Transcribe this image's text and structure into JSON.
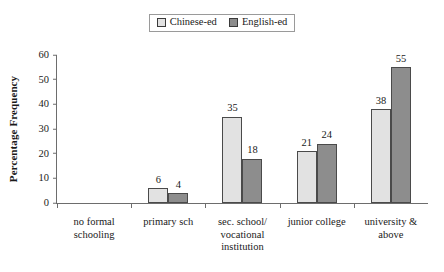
{
  "chart_data": {
    "type": "bar",
    "title": "",
    "xlabel": "",
    "ylabel": "Percentage Frequency",
    "ylim": [
      0,
      60
    ],
    "yticks": [
      0,
      10,
      20,
      30,
      40,
      50,
      60
    ],
    "grid": false,
    "legend_position": "top-center",
    "categories": [
      "no formal schooling",
      "primary sch",
      "sec. school/ vocational institution",
      "junior college",
      "university & above"
    ],
    "category_lines": [
      [
        "no formal",
        "schooling"
      ],
      [
        "primary sch"
      ],
      [
        "sec. school/",
        "vocational",
        "institution"
      ],
      [
        "junior college"
      ],
      [
        "university &",
        "above"
      ]
    ],
    "series": [
      {
        "name": "Chinese-ed",
        "color": "#e2e2e2",
        "values": [
          null,
          6,
          35,
          21,
          38
        ],
        "labels": [
          "",
          "6",
          "35",
          "21",
          "38"
        ]
      },
      {
        "name": "English-ed",
        "color": "#8d8d8d",
        "values": [
          null,
          4,
          18,
          24,
          55
        ],
        "labels": [
          "",
          "4",
          "18",
          "24",
          "55"
        ]
      }
    ]
  },
  "legend": {
    "entries": [
      {
        "label": "Chinese-ed",
        "swatch": "#e2e2e2"
      },
      {
        "label": "English-ed",
        "swatch": "#8d8d8d"
      }
    ]
  }
}
